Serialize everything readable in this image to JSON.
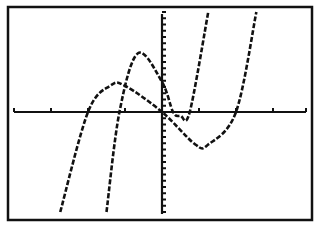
{
  "chart_data": {
    "type": "line",
    "title": "",
    "xlabel": "",
    "ylabel": "",
    "grid": false,
    "legend": null,
    "style": "graphing-calculator pixel plot",
    "xlim": [
      -4,
      4
    ],
    "ylim": [
      -4,
      4
    ],
    "x_tick_spacing": 1,
    "y_tick_spacing": 0.25,
    "series": [
      {
        "name": "f(x)",
        "description": "shallow cubic, roots near x=-2, 0, 2",
        "points": [
          [
            -2.75,
            -4
          ],
          [
            -2,
            0
          ],
          [
            -1.4,
            1.05
          ],
          [
            -1,
            1.05
          ],
          [
            0,
            0
          ],
          [
            0.9,
            -1.3
          ],
          [
            1.25,
            -1.3
          ],
          [
            2,
            0
          ],
          [
            2.55,
            4
          ]
        ]
      },
      {
        "name": "g(x)",
        "description": "steeper cubic shifted left/up, roots near x=-1.15, ~0.3, ~0.75",
        "points": [
          [
            -1.5,
            -4
          ],
          [
            -1.15,
            0
          ],
          [
            -0.65,
            2.35
          ],
          [
            0,
            1.2
          ],
          [
            0.3,
            0
          ],
          [
            0.5,
            -0.15
          ],
          [
            0.75,
            0
          ],
          [
            1.25,
            4
          ]
        ]
      }
    ],
    "colors": {
      "foreground": "#111111",
      "background": "#ffffff"
    }
  }
}
